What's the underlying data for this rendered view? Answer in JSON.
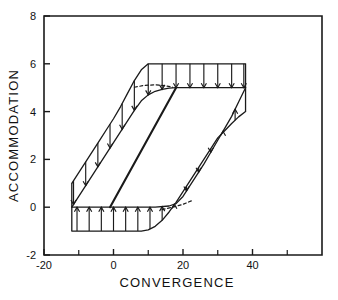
{
  "chart_data": {
    "type": "line",
    "title": "",
    "xlabel": "CONVERGENCE",
    "ylabel": "ACCOMMODATION",
    "xlim": [
      -20,
      60
    ],
    "ylim": [
      -2,
      8
    ],
    "xticks": [
      -20,
      0,
      20,
      40
    ],
    "xtick_labels": [
      "-20",
      "0",
      "20",
      "40"
    ],
    "xminor_ticks": [
      -10,
      10,
      30,
      50
    ],
    "yticks": [
      -2,
      0,
      2,
      4,
      6,
      8
    ],
    "ytick_labels": [
      "-2",
      "0",
      "2",
      "4",
      "6",
      "8"
    ],
    "grid": false,
    "legend": null,
    "annotations": [
      "Upper band: outer curve rises from (-12,1) through sigmoid to plateau at y=6 from x=10 to x=38",
      "Upper band: inner curve rises from (-12,0) through sigmoid to plateau at y=5 from x=18 to x=38",
      "Lower band: outer curve from (-12,-1) flat to x=10 then rises to (38,4)",
      "Lower band: inner curve from (-12,0) flat to x=18 then rises to (38,5)",
      "Downward arrows span upper band from outer to inner curve",
      "Upward arrows span lower band from outer to inner curve",
      "Central heavy diagonal from (-1,0) to (18,5)",
      "Dashed segment in upper band near y=5 between x=6 and x=16",
      "Dashed segment in lower band near y=0 between x=14 and x=24"
    ],
    "series": [
      {
        "name": "upper-outer-curve",
        "style": "solid",
        "points": [
          [
            -12,
            1
          ],
          [
            -10,
            1.45
          ],
          [
            -8,
            1.9
          ],
          [
            -6,
            2.35
          ],
          [
            -4,
            2.8
          ],
          [
            -2,
            3.25
          ],
          [
            0,
            3.7
          ],
          [
            2,
            4.2
          ],
          [
            4,
            4.75
          ],
          [
            6,
            5.3
          ],
          [
            8,
            5.75
          ],
          [
            10,
            6
          ],
          [
            14,
            6
          ],
          [
            18,
            6
          ],
          [
            22,
            6
          ],
          [
            26,
            6
          ],
          [
            30,
            6
          ],
          [
            34,
            6
          ],
          [
            38,
            6
          ]
        ]
      },
      {
        "name": "upper-inner-curve",
        "style": "solid",
        "points": [
          [
            -12,
            0
          ],
          [
            -10,
            0.45
          ],
          [
            -8,
            0.9
          ],
          [
            -6,
            1.35
          ],
          [
            -4,
            1.8
          ],
          [
            -2,
            2.25
          ],
          [
            0,
            2.7
          ],
          [
            2,
            3.15
          ],
          [
            4,
            3.6
          ],
          [
            6,
            4.05
          ],
          [
            8,
            4.45
          ],
          [
            10,
            4.7
          ],
          [
            12,
            4.85
          ],
          [
            14,
            4.93
          ],
          [
            16,
            4.98
          ],
          [
            18,
            5
          ],
          [
            22,
            5
          ],
          [
            26,
            5
          ],
          [
            30,
            5
          ],
          [
            34,
            5
          ],
          [
            38,
            5
          ]
        ]
      },
      {
        "name": "lower-outer-curve",
        "style": "solid",
        "points": [
          [
            -12,
            -1
          ],
          [
            -8,
            -1
          ],
          [
            -4,
            -1
          ],
          [
            0,
            -1
          ],
          [
            4,
            -1
          ],
          [
            8,
            -1
          ],
          [
            10,
            -0.95
          ],
          [
            12,
            -0.8
          ],
          [
            14,
            -0.55
          ],
          [
            16,
            -0.2
          ],
          [
            18,
            0.2
          ],
          [
            20,
            0.65
          ],
          [
            22,
            1.1
          ],
          [
            24,
            1.55
          ],
          [
            26,
            2
          ],
          [
            28,
            2.45
          ],
          [
            30,
            2.9
          ],
          [
            32,
            3.2
          ],
          [
            34,
            3.5
          ],
          [
            36,
            3.78
          ],
          [
            38,
            4
          ]
        ]
      },
      {
        "name": "lower-inner-curve",
        "style": "solid",
        "points": [
          [
            -12,
            0
          ],
          [
            -8,
            0
          ],
          [
            -4,
            0
          ],
          [
            0,
            0
          ],
          [
            4,
            0
          ],
          [
            8,
            0
          ],
          [
            12,
            0
          ],
          [
            16,
            0.05
          ],
          [
            18,
            0.15
          ],
          [
            20,
            0.45
          ],
          [
            22,
            0.9
          ],
          [
            24,
            1.35
          ],
          [
            26,
            1.8
          ],
          [
            28,
            2.3
          ],
          [
            30,
            2.8
          ],
          [
            32,
            3.3
          ],
          [
            34,
            3.8
          ],
          [
            36,
            4.4
          ],
          [
            38,
            5
          ]
        ]
      },
      {
        "name": "central-diagonal",
        "style": "solid-heavy",
        "points": [
          [
            -1,
            0
          ],
          [
            18,
            5
          ]
        ]
      },
      {
        "name": "upper-dashed-segment",
        "style": "dashed",
        "points": [
          [
            6,
            5.02
          ],
          [
            9,
            5.1
          ],
          [
            12,
            5.12
          ],
          [
            15,
            5.08
          ],
          [
            17,
            5.02
          ]
        ]
      },
      {
        "name": "lower-dashed-segment",
        "style": "dashed",
        "points": [
          [
            14,
            -0.1
          ],
          [
            17,
            0.0
          ],
          [
            20,
            0.12
          ],
          [
            23,
            0.3
          ]
        ]
      }
    ],
    "upper_arrows": {
      "direction": "down",
      "x_positions": [
        -11.5,
        -8,
        -4.5,
        -1,
        2.5,
        6,
        10,
        14,
        18,
        22,
        26,
        30,
        34,
        37.5
      ]
    },
    "lower_arrows": {
      "direction": "up",
      "x_positions": [
        -10.5,
        -7,
        -3.5,
        0,
        3.5,
        7,
        10.5,
        14,
        17.5,
        21,
        24.5,
        28,
        31.5,
        35
      ]
    }
  },
  "axes": {
    "x_title": "CONVERGENCE",
    "y_title": "ACCOMMODATION"
  }
}
